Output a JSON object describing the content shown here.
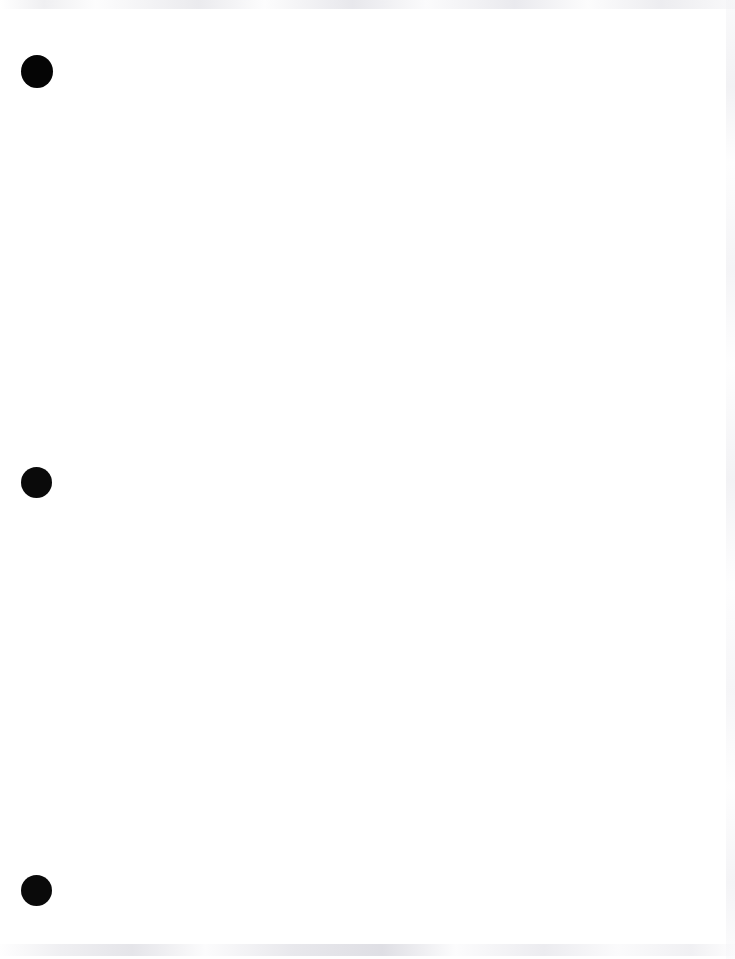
{
  "document": {
    "page_background_color": "#ffffff",
    "page_width": 735,
    "page_height": 959,
    "body_text": ""
  },
  "margin_marks": {
    "label": "punch-holes",
    "color": "#080808",
    "items": [
      {
        "name": "punch-hole-top",
        "shape": "circle",
        "center_x": 37,
        "center_y": 71,
        "diameter": 32,
        "color": "#050505"
      },
      {
        "name": "punch-hole-middle",
        "shape": "circle",
        "center_x": 36,
        "center_y": 482,
        "diameter": 31,
        "color": "#0a0a0a"
      },
      {
        "name": "punch-hole-bottom",
        "shape": "circle",
        "center_x": 36,
        "center_y": 890,
        "diameter": 31,
        "color": "#0a0a0a"
      }
    ]
  },
  "scan_artifacts": {
    "top_edge": {
      "name": "scan-noise-top",
      "color": "#eaeaed"
    },
    "bottom_edge": {
      "name": "scan-noise-bottom",
      "color": "#e2e2e7"
    },
    "right_edge": {
      "name": "scan-noise-right",
      "color": "#ebebef"
    }
  }
}
